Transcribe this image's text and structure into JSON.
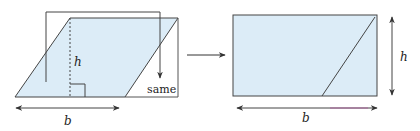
{
  "diagram": {
    "colors": {
      "fill": "#dcecf7",
      "stroke": "#444444",
      "arrow": "#333333",
      "accent_underline": "#b04a9a"
    },
    "left_figure": {
      "shape": "parallelogram",
      "height_label": "h",
      "base_label": "b",
      "moved_piece_label": "same"
    },
    "transition_arrow": "right-arrow",
    "right_figure": {
      "shape": "rectangle",
      "height_label": "h",
      "base_label": "b"
    }
  }
}
